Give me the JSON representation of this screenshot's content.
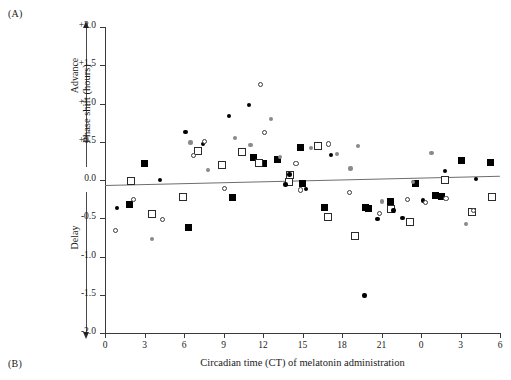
{
  "figure": {
    "panel_a_label": "(A)",
    "panel_b_label": "(B)"
  },
  "axes": {
    "y_title": "Phase shift (hours)",
    "x_title": "Circadian time (CT) of melatonin administration",
    "advance_label": "Advance",
    "delay_label": "Delay"
  },
  "chart_data": {
    "type": "scatter",
    "title": "",
    "xlabel": "Circadian time (CT) of melatonin administration",
    "ylabel": "Phase shift (hours)",
    "xlim": [
      0,
      30
    ],
    "ylim": [
      -2.0,
      2.0
    ],
    "grid": false,
    "legend_position": "none",
    "x_tick_values": [
      0,
      3,
      6,
      9,
      12,
      15,
      18,
      21,
      24,
      27,
      30
    ],
    "x_tick_labels": [
      "0",
      "3",
      "6",
      "9",
      "12",
      "15",
      "18",
      "21",
      "0",
      "3",
      "6"
    ],
    "y_tick_values": [
      2.0,
      1.5,
      1.0,
      0.5,
      0.0,
      -0.5,
      -1.0,
      -1.5,
      -2.0
    ],
    "y_tick_labels": [
      "+2.0",
      "+1.5",
      "+1.0",
      "+0.5",
      "0.0",
      "-0.5",
      "-1.0",
      "-1.5",
      "-2.0"
    ],
    "annotations": [
      "Advance",
      "Delay"
    ],
    "trend_line": {
      "x0": 0,
      "y0": -0.06,
      "x1": 30,
      "y1": 0.06
    },
    "series": [
      {
        "name": "filled-square",
        "marker": "filled square",
        "points": [
          [
            2.97,
            0.21
          ],
          [
            1.86,
            -0.32
          ],
          [
            6.31,
            -0.62
          ],
          [
            9.72,
            -0.23
          ],
          [
            11.25,
            0.3
          ],
          [
            13.09,
            0.27
          ],
          [
            12.02,
            0.21
          ],
          [
            14.86,
            0.43
          ],
          [
            15.02,
            -0.05
          ],
          [
            16.65,
            -0.36
          ],
          [
            19.8,
            -0.36
          ],
          [
            20.0,
            -0.37
          ],
          [
            21.65,
            -0.28
          ],
          [
            23.55,
            -0.04
          ],
          [
            25.1,
            -0.2
          ],
          [
            25.55,
            -0.22
          ],
          [
            27.1,
            0.25
          ],
          [
            29.25,
            0.23
          ]
        ]
      },
      {
        "name": "open-square",
        "marker": "open square",
        "points": [
          [
            2.0,
            -0.01
          ],
          [
            3.6,
            -0.44
          ],
          [
            5.95,
            -0.22
          ],
          [
            7.05,
            0.38
          ],
          [
            8.9,
            0.2
          ],
          [
            10.4,
            0.37
          ],
          [
            11.7,
            0.22
          ],
          [
            13.95,
            -0.02
          ],
          [
            14.05,
            0.06
          ],
          [
            16.9,
            -0.48
          ],
          [
            19.0,
            -0.73
          ],
          [
            21.7,
            -0.38
          ],
          [
            23.2,
            -0.55
          ],
          [
            25.8,
            0.0
          ],
          [
            27.9,
            -0.42
          ],
          [
            29.4,
            -0.22
          ],
          [
            16.2,
            0.44
          ]
        ]
      },
      {
        "name": "filled-circle",
        "marker": "small filled circle",
        "points": [
          [
            0.9,
            -0.37
          ],
          [
            4.2,
            0.0
          ],
          [
            6.1,
            0.63
          ],
          [
            7.45,
            0.47
          ],
          [
            9.4,
            0.84
          ],
          [
            10.95,
            0.98
          ],
          [
            13.7,
            -0.06
          ],
          [
            14.0,
            0.07
          ],
          [
            15.25,
            -0.12
          ],
          [
            17.15,
            0.33
          ],
          [
            19.7,
            -1.51
          ],
          [
            20.7,
            -0.51
          ],
          [
            21.9,
            -0.4
          ],
          [
            22.6,
            -0.5
          ],
          [
            24.15,
            -0.27
          ],
          [
            25.8,
            0.12
          ],
          [
            28.2,
            0.01
          ]
        ]
      },
      {
        "name": "open-circle",
        "marker": "open circle",
        "points": [
          [
            0.8,
            -0.66
          ],
          [
            2.15,
            -0.25
          ],
          [
            4.35,
            -0.52
          ],
          [
            6.75,
            0.32
          ],
          [
            9.05,
            -0.11
          ],
          [
            11.8,
            1.25
          ],
          [
            12.1,
            0.62
          ],
          [
            14.5,
            0.22
          ],
          [
            14.85,
            -0.13
          ],
          [
            17.0,
            0.47
          ],
          [
            18.55,
            -0.16
          ],
          [
            20.85,
            -0.44
          ],
          [
            22.95,
            -0.26
          ],
          [
            24.35,
            -0.29
          ],
          [
            25.9,
            -0.24
          ],
          [
            28.0,
            -0.4
          ],
          [
            7.55,
            0.5
          ]
        ]
      },
      {
        "name": "gray-dot",
        "marker": "gray dot",
        "points": [
          [
            3.55,
            -0.77
          ],
          [
            6.5,
            0.49
          ],
          [
            7.85,
            0.13
          ],
          [
            9.9,
            0.55
          ],
          [
            11.05,
            0.46
          ],
          [
            12.6,
            0.8
          ],
          [
            13.3,
            0.3
          ],
          [
            15.65,
            0.42
          ],
          [
            17.6,
            0.34
          ],
          [
            18.65,
            0.15
          ],
          [
            21.05,
            -0.28
          ],
          [
            23.4,
            -0.03
          ],
          [
            24.8,
            0.35
          ],
          [
            27.4,
            -0.58
          ],
          [
            19.2,
            0.44
          ]
        ]
      }
    ]
  }
}
